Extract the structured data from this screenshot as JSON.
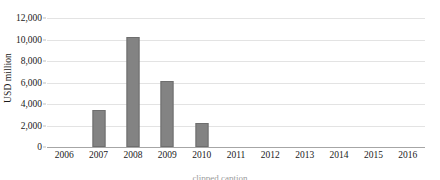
{
  "chart_data": {
    "type": "bar",
    "title": "",
    "xlabel": "",
    "ylabel": "USD million",
    "categories": [
      "2006",
      "2007",
      "2008",
      "2009",
      "2010",
      "2011",
      "2012",
      "2013",
      "2014",
      "2015",
      "2016"
    ],
    "values": [
      0,
      3400,
      10200,
      6100,
      2200,
      0,
      0,
      0,
      0,
      0,
      0
    ],
    "ylim": [
      0,
      12000
    ],
    "ytick_values": [
      0,
      2000,
      4000,
      6000,
      8000,
      10000,
      12000
    ],
    "ytick_labels": [
      "0",
      "2,000",
      "4,000",
      "6,000",
      "8,000",
      "10,000",
      "12,000"
    ],
    "grid": true,
    "legend": false,
    "legend_position": "none",
    "bar_color": "#838383",
    "bar_border_color": "#6e6e6e",
    "gridline_color": "#e3e3e3",
    "axis_color": "#a6a6a6"
  },
  "caption": {
    "clipped_text": "clipped caption"
  }
}
